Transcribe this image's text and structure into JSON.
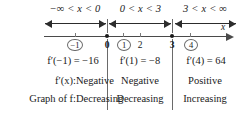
{
  "figure": {
    "type": "sign-chart",
    "axis_variable": "x",
    "intervals": [
      {
        "range_label": "−∞ < x < 0",
        "test_value": "−1",
        "derivative_expression": "f′(−1) = −16",
        "derivative_sign": "Negative",
        "graph_behavior": "Decreasing"
      },
      {
        "range_label": "0 < x < 3",
        "test_value": "1",
        "derivative_expression": "f′(1) = −8",
        "derivative_sign": "Negative",
        "graph_behavior": "Decreasing"
      },
      {
        "range_label": "3 < x < ∞",
        "test_value": "4",
        "derivative_expression": "f′(4) = 64",
        "derivative_sign": "Positive",
        "graph_behavior": "Increasing"
      }
    ],
    "number_line": {
      "ticks": [
        {
          "label": "−1",
          "circled": true,
          "bold": false,
          "critical": false
        },
        {
          "label": "0",
          "circled": false,
          "bold": true,
          "critical": true
        },
        {
          "label": "1",
          "circled": true,
          "bold": false,
          "critical": false
        },
        {
          "label": "2",
          "circled": false,
          "bold": false,
          "critical": false
        },
        {
          "label": "3",
          "circled": false,
          "bold": true,
          "critical": true
        },
        {
          "label": "4",
          "circled": true,
          "bold": false,
          "critical": false
        }
      ],
      "critical_values": [
        "0",
        "3"
      ]
    },
    "rows": {
      "derivative_label": "f′(x):",
      "graph_label": "Graph of f:"
    },
    "colors": {
      "ink": "#1a1a1a",
      "line": "#4a4a4a",
      "divider": "#6a6a6a",
      "background": "#ffffff"
    }
  }
}
